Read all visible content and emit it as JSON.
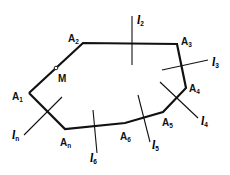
{
  "diagram": {
    "polygon_vertices": [
      {
        "name": "A",
        "sub": "1",
        "x": 29,
        "y": 93,
        "lx": 12,
        "ly": 100
      },
      {
        "name": "A",
        "sub": "2",
        "x": 83,
        "y": 43,
        "lx": 68,
        "ly": 42
      },
      {
        "name": "A",
        "sub": "3",
        "x": 177,
        "y": 44,
        "lx": 181,
        "ly": 45
      },
      {
        "name": "A",
        "sub": "4",
        "x": 186,
        "y": 88,
        "lx": 189,
        "ly": 92
      },
      {
        "name": "A",
        "sub": "5",
        "x": 163,
        "y": 112,
        "lx": 162,
        "ly": 126
      },
      {
        "name": "A",
        "sub": "6",
        "x": 125,
        "y": 123,
        "lx": 120,
        "ly": 140
      },
      {
        "name": "A",
        "sub": "n",
        "x": 65,
        "y": 129,
        "lx": 60,
        "ly": 146
      }
    ],
    "point_M": {
      "label": "M",
      "x": 56,
      "y": 68,
      "lx": 58,
      "ly": 82
    },
    "lines": [
      {
        "name": "l",
        "sub": "2",
        "x1": 132,
        "y1": 16,
        "x2": 132,
        "y2": 65,
        "lx": 137,
        "ly": 24
      },
      {
        "name": "l",
        "sub": "3",
        "x1": 162,
        "y1": 70,
        "x2": 208,
        "y2": 60,
        "lx": 212,
        "ly": 66
      },
      {
        "name": "l",
        "sub": "4",
        "x1": 160,
        "y1": 82,
        "x2": 198,
        "y2": 118,
        "lx": 201,
        "ly": 125
      },
      {
        "name": "l",
        "sub": "5",
        "x1": 138,
        "y1": 95,
        "x2": 150,
        "y2": 142,
        "lx": 152,
        "ly": 149
      },
      {
        "name": "l",
        "sub": "6",
        "x1": 93,
        "y1": 110,
        "x2": 97,
        "y2": 153,
        "lx": 90,
        "ly": 162
      },
      {
        "name": "l",
        "sub": "n",
        "x1": 24,
        "y1": 135,
        "x2": 62,
        "y2": 97,
        "lx": 12,
        "ly": 139
      }
    ]
  }
}
